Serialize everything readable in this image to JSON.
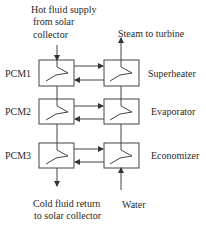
{
  "labels": {
    "hot_supply_line1": "Hot fluid supply",
    "hot_supply_line2": "from solar",
    "hot_supply_line3": "collector",
    "steam": "Steam to turbine",
    "cold_return_line1": "Cold fluid return",
    "cold_return_line2": "to solar collector",
    "water": "Water"
  },
  "pcm_units": [
    {
      "label": "PCM1"
    },
    {
      "label": "PCM2"
    },
    {
      "label": "PCM3"
    }
  ],
  "heat_exchangers": [
    {
      "label": "Superheater"
    },
    {
      "label": "Evaporator"
    },
    {
      "label": "Economizer"
    }
  ],
  "colors": {
    "line": "#444444",
    "text": "#2a2a2a"
  }
}
